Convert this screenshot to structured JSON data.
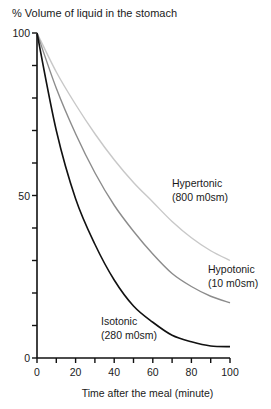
{
  "chart_data": {
    "type": "line",
    "title": "% Volume of liquid in the stomach",
    "xlabel": "Time after the meal (minute)",
    "ylabel": "% Volume of liquid in the stomach",
    "xlim": [
      0,
      100
    ],
    "ylim": [
      0,
      100
    ],
    "x_ticks": [
      0,
      20,
      40,
      60,
      80,
      100
    ],
    "x_minor_ticks": [
      10,
      30,
      50,
      70,
      90
    ],
    "y_ticks": [
      0,
      50,
      100
    ],
    "y_minor_ticks": [
      10,
      20,
      30,
      40,
      60,
      70,
      80,
      90
    ],
    "grid": false,
    "legend": "inline labels",
    "x": [
      0,
      10,
      20,
      30,
      40,
      50,
      60,
      70,
      80,
      90,
      100
    ],
    "series": [
      {
        "name": "Hypertonic",
        "sublabel": "(800 m0sm)",
        "color": "#c8c8c8",
        "values": [
          100,
          88,
          78,
          69,
          61,
          54,
          48,
          42,
          37,
          33,
          30
        ]
      },
      {
        "name": "Hypotonic",
        "sublabel": "(10 m0sm)",
        "color": "#8c8c8c",
        "values": [
          100,
          83,
          69,
          57,
          47,
          39,
          32,
          26,
          22,
          19,
          17
        ]
      },
      {
        "name": "Isotonic",
        "sublabel": "(280 m0sm)",
        "color": "#111111",
        "values": [
          100,
          70,
          49,
          35,
          24,
          16,
          11,
          7,
          5,
          3.7,
          3.5
        ]
      }
    ]
  }
}
